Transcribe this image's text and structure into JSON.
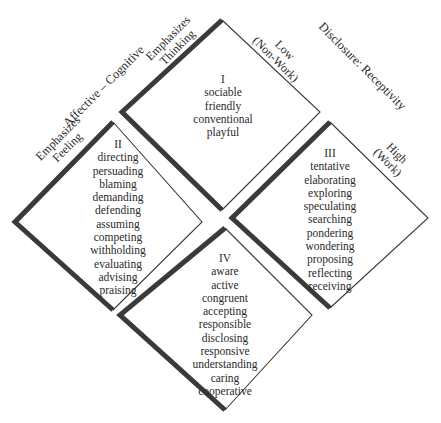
{
  "axes": {
    "affective_cognitive": {
      "title": "Affective – Cognitive",
      "pole_left": "Emphasizes\nFeeling",
      "pole_left_line1": "Emphasizes",
      "pole_left_line2": "Feeling",
      "pole_right_line1": "Emphasizes",
      "pole_right_line2": "Thinking"
    },
    "disclosure_receptivity": {
      "title": "Disclosure: Receptivity",
      "low_line1": "Low",
      "low_line2": "(Non-Work)",
      "high_line1": "High",
      "high_line2": "(Work)"
    }
  },
  "quadrants": [
    {
      "numeral": "I",
      "words": [
        "sociable",
        "friendly",
        "conventional",
        "playful"
      ]
    },
    {
      "numeral": "II",
      "words": [
        "directing",
        "persuading",
        "blaming",
        "demanding",
        "defending",
        "assuming",
        "competing",
        "withholding",
        "evaluating",
        "advising",
        "praising"
      ]
    },
    {
      "numeral": "III",
      "words": [
        "tentative",
        "elaborating",
        "exploring",
        "speculating",
        "searching",
        "pondering",
        "wondering",
        "proposing",
        "reflecting",
        "receiving"
      ]
    },
    {
      "numeral": "IV",
      "words": [
        "aware",
        "active",
        "congruent",
        "accepting",
        "responsible",
        "disclosing",
        "responsive",
        "understanding",
        "caring",
        "cooperative"
      ]
    }
  ],
  "colors": {
    "thick_edge": "#3a3a3a",
    "thin_edge": "#3a3a3a",
    "text": "#2a2a2a",
    "background": "#ffffff"
  }
}
